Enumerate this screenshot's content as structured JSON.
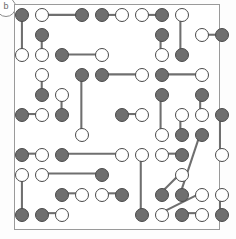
{
  "figure": {
    "panel_label": "b",
    "colors": {
      "filled_node": "#6f6f6f",
      "open_node": "#ffffff",
      "node_outline": "#4a4a4a",
      "edge": "#6f6f6f",
      "frame": "#9a9a9a",
      "background": "#ffffff"
    }
  },
  "chart_data": {
    "type": "scatter",
    "title": "",
    "xlabel": "",
    "ylabel": "",
    "grid": false,
    "legend": [],
    "lattice": {
      "columns_x": [
        21,
        41,
        61,
        81,
        101,
        121,
        141,
        161,
        181,
        201
      ],
      "rows_y": [
        14,
        34,
        54,
        74,
        94,
        114,
        134,
        154,
        174,
        194,
        214
      ],
      "node_radius": 7,
      "spacing": 20
    },
    "node_types": [
      "filled",
      "open"
    ],
    "nodes": [
      {
        "id": 0,
        "x": 21,
        "y": 14,
        "type": "filled"
      },
      {
        "id": 1,
        "x": 41,
        "y": 14,
        "type": "open"
      },
      {
        "id": 2,
        "x": 81,
        "y": 14,
        "type": "filled"
      },
      {
        "id": 3,
        "x": 101,
        "y": 14,
        "type": "filled"
      },
      {
        "id": 4,
        "x": 121,
        "y": 14,
        "type": "open"
      },
      {
        "id": 5,
        "x": 141,
        "y": 14,
        "type": "open"
      },
      {
        "id": 6,
        "x": 161,
        "y": 14,
        "type": "filled"
      },
      {
        "id": 7,
        "x": 181,
        "y": 14,
        "type": "open"
      },
      {
        "id": 8,
        "x": 41,
        "y": 34,
        "type": "filled"
      },
      {
        "id": 9,
        "x": 161,
        "y": 34,
        "type": "filled"
      },
      {
        "id": 10,
        "x": 201,
        "y": 34,
        "type": "open"
      },
      {
        "id": 11,
        "x": 221,
        "y": 34,
        "type": "filled"
      },
      {
        "id": 12,
        "x": 21,
        "y": 54,
        "type": "open"
      },
      {
        "id": 13,
        "x": 41,
        "y": 54,
        "type": "open"
      },
      {
        "id": 14,
        "x": 61,
        "y": 54,
        "type": "filled"
      },
      {
        "id": 15,
        "x": 101,
        "y": 54,
        "type": "open"
      },
      {
        "id": 16,
        "x": 161,
        "y": 54,
        "type": "open"
      },
      {
        "id": 17,
        "x": 181,
        "y": 54,
        "type": "filled"
      },
      {
        "id": 18,
        "x": 41,
        "y": 74,
        "type": "open"
      },
      {
        "id": 19,
        "x": 81,
        "y": 74,
        "type": "filled"
      },
      {
        "id": 20,
        "x": 101,
        "y": 74,
        "type": "filled"
      },
      {
        "id": 21,
        "x": 141,
        "y": 74,
        "type": "open"
      },
      {
        "id": 22,
        "x": 161,
        "y": 74,
        "type": "filled"
      },
      {
        "id": 23,
        "x": 201,
        "y": 74,
        "type": "open"
      },
      {
        "id": 24,
        "x": 41,
        "y": 94,
        "type": "filled"
      },
      {
        "id": 25,
        "x": 61,
        "y": 94,
        "type": "open"
      },
      {
        "id": 26,
        "x": 161,
        "y": 94,
        "type": "filled"
      },
      {
        "id": 27,
        "x": 201,
        "y": 94,
        "type": "filled"
      },
      {
        "id": 28,
        "x": 21,
        "y": 114,
        "type": "filled"
      },
      {
        "id": 29,
        "x": 41,
        "y": 114,
        "type": "open"
      },
      {
        "id": 30,
        "x": 61,
        "y": 114,
        "type": "filled"
      },
      {
        "id": 31,
        "x": 121,
        "y": 114,
        "type": "filled"
      },
      {
        "id": 32,
        "x": 141,
        "y": 114,
        "type": "open"
      },
      {
        "id": 33,
        "x": 181,
        "y": 114,
        "type": "open"
      },
      {
        "id": 34,
        "x": 201,
        "y": 114,
        "type": "open"
      },
      {
        "id": 35,
        "x": 221,
        "y": 114,
        "type": "filled"
      },
      {
        "id": 36,
        "x": 81,
        "y": 134,
        "type": "open"
      },
      {
        "id": 37,
        "x": 161,
        "y": 134,
        "type": "open"
      },
      {
        "id": 38,
        "x": 181,
        "y": 134,
        "type": "filled"
      },
      {
        "id": 39,
        "x": 201,
        "y": 134,
        "type": "filled"
      },
      {
        "id": 40,
        "x": 21,
        "y": 154,
        "type": "filled"
      },
      {
        "id": 41,
        "x": 41,
        "y": 154,
        "type": "open"
      },
      {
        "id": 42,
        "x": 61,
        "y": 154,
        "type": "filled"
      },
      {
        "id": 43,
        "x": 121,
        "y": 154,
        "type": "open"
      },
      {
        "id": 44,
        "x": 141,
        "y": 154,
        "type": "open"
      },
      {
        "id": 45,
        "x": 161,
        "y": 154,
        "type": "open"
      },
      {
        "id": 46,
        "x": 181,
        "y": 154,
        "type": "filled"
      },
      {
        "id": 47,
        "x": 221,
        "y": 154,
        "type": "open"
      },
      {
        "id": 48,
        "x": 21,
        "y": 174,
        "type": "open"
      },
      {
        "id": 49,
        "x": 41,
        "y": 174,
        "type": "open"
      },
      {
        "id": 50,
        "x": 101,
        "y": 174,
        "type": "filled"
      },
      {
        "id": 51,
        "x": 181,
        "y": 174,
        "type": "open"
      },
      {
        "id": 52,
        "x": 61,
        "y": 194,
        "type": "filled"
      },
      {
        "id": 53,
        "x": 81,
        "y": 194,
        "type": "open"
      },
      {
        "id": 54,
        "x": 101,
        "y": 194,
        "type": "open"
      },
      {
        "id": 55,
        "x": 121,
        "y": 194,
        "type": "filled"
      },
      {
        "id": 56,
        "x": 161,
        "y": 194,
        "type": "filled"
      },
      {
        "id": 57,
        "x": 181,
        "y": 194,
        "type": "filled"
      },
      {
        "id": 58,
        "x": 201,
        "y": 194,
        "type": "open"
      },
      {
        "id": 59,
        "x": 221,
        "y": 194,
        "type": "open"
      },
      {
        "id": 60,
        "x": 21,
        "y": 214,
        "type": "filled"
      },
      {
        "id": 61,
        "x": 41,
        "y": 214,
        "type": "filled"
      },
      {
        "id": 62,
        "x": 61,
        "y": 214,
        "type": "open"
      },
      {
        "id": 63,
        "x": 141,
        "y": 214,
        "type": "filled"
      },
      {
        "id": 64,
        "x": 161,
        "y": 214,
        "type": "open"
      },
      {
        "id": 65,
        "x": 181,
        "y": 214,
        "type": "filled"
      },
      {
        "id": 66,
        "x": 201,
        "y": 214,
        "type": "open"
      },
      {
        "id": 67,
        "x": 221,
        "y": 214,
        "type": "filled"
      }
    ],
    "edges": [
      {
        "from": 0,
        "to": 12,
        "orientation": "vertical"
      },
      {
        "from": 1,
        "to": 2,
        "orientation": "horizontal"
      },
      {
        "from": 3,
        "to": 4,
        "orientation": "horizontal"
      },
      {
        "from": 5,
        "to": 6,
        "orientation": "horizontal"
      },
      {
        "from": 7,
        "to": 17,
        "orientation": "vertical"
      },
      {
        "from": 8,
        "to": 13,
        "orientation": "vertical"
      },
      {
        "from": 9,
        "to": 16,
        "orientation": "vertical"
      },
      {
        "from": 10,
        "to": 11,
        "orientation": "horizontal"
      },
      {
        "from": 14,
        "to": 15,
        "orientation": "horizontal"
      },
      {
        "from": 18,
        "to": 24,
        "orientation": "vertical"
      },
      {
        "from": 19,
        "to": 36,
        "orientation": "vertical"
      },
      {
        "from": 20,
        "to": 21,
        "orientation": "horizontal"
      },
      {
        "from": 22,
        "to": 23,
        "orientation": "horizontal"
      },
      {
        "from": 25,
        "to": 30,
        "orientation": "vertical"
      },
      {
        "from": 26,
        "to": 37,
        "orientation": "vertical"
      },
      {
        "from": 27,
        "to": 34,
        "orientation": "vertical"
      },
      {
        "from": 28,
        "to": 29,
        "orientation": "horizontal"
      },
      {
        "from": 31,
        "to": 32,
        "orientation": "horizontal"
      },
      {
        "from": 33,
        "to": 38,
        "orientation": "vertical"
      },
      {
        "from": 35,
        "to": 47,
        "orientation": "vertical"
      },
      {
        "from": 39,
        "to": 57,
        "orientation": "vertical"
      },
      {
        "from": 40,
        "to": 41,
        "orientation": "horizontal"
      },
      {
        "from": 42,
        "to": 43,
        "orientation": "horizontal"
      },
      {
        "from": 44,
        "to": 63,
        "orientation": "vertical"
      },
      {
        "from": 45,
        "to": 46,
        "orientation": "horizontal"
      },
      {
        "from": 48,
        "to": 60,
        "orientation": "vertical"
      },
      {
        "from": 49,
        "to": 50,
        "orientation": "horizontal"
      },
      {
        "from": 51,
        "to": 56,
        "orientation": "vertical"
      },
      {
        "from": 52,
        "to": 53,
        "orientation": "horizontal"
      },
      {
        "from": 54,
        "to": 55,
        "orientation": "horizontal"
      },
      {
        "from": 58,
        "to": 64,
        "orientation": "vertical"
      },
      {
        "from": 59,
        "to": 67,
        "orientation": "vertical"
      },
      {
        "from": 61,
        "to": 62,
        "orientation": "horizontal"
      },
      {
        "from": 65,
        "to": 66,
        "orientation": "horizontal"
      }
    ]
  }
}
